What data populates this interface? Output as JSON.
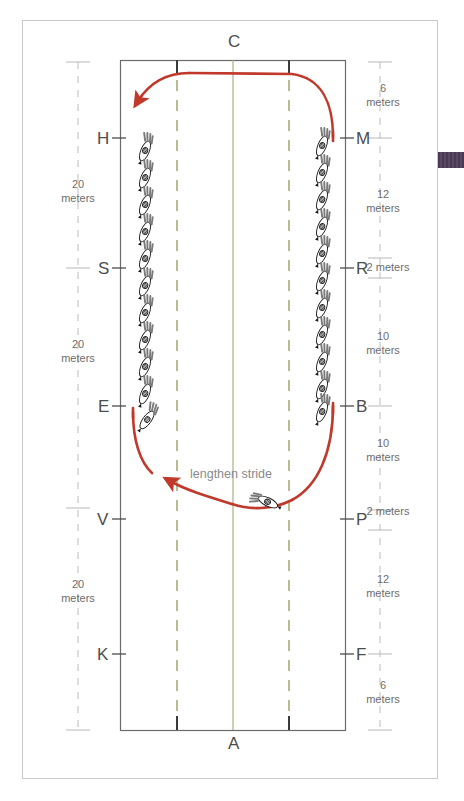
{
  "diagram": {
    "arena": {
      "top_marker": "C",
      "bottom_marker": "A",
      "left_letters": [
        "H",
        "S",
        "E",
        "V",
        "K"
      ],
      "right_letters": [
        "M",
        "R",
        "B",
        "P",
        "F"
      ]
    },
    "annotation": "lengthen stride",
    "left_scale": [
      {
        "value": "20",
        "unit": "meters"
      },
      {
        "value": "20",
        "unit": "meters"
      },
      {
        "value": "20",
        "unit": "meters"
      }
    ],
    "right_scale": [
      {
        "value": "6",
        "unit": "meters"
      },
      {
        "value": "12",
        "unit": "meters"
      },
      {
        "value": "2 meters",
        "unit": ""
      },
      {
        "value": "10",
        "unit": "meters"
      },
      {
        "value": "10",
        "unit": "meters"
      },
      {
        "value": "2 meters",
        "unit": ""
      },
      {
        "value": "12",
        "unit": "meters"
      },
      {
        "value": "6",
        "unit": "meters"
      }
    ],
    "colors": {
      "track_path": "#c0392b",
      "arena_wall": "#6b6b6b",
      "center_line": "#a8a87a",
      "quarter_line": "#a8a87a",
      "scale_text": "#6d6d6d",
      "letter_text": "#4d4d4d",
      "annotation_text": "#8a8a8a",
      "page_border": "#c9c9c9",
      "tab_marker": "#4a3a52"
    },
    "horses": {
      "left_rail_count": 11,
      "right_rail_count": 11,
      "moving_horse_label": "lengthen-stride-horse"
    }
  }
}
